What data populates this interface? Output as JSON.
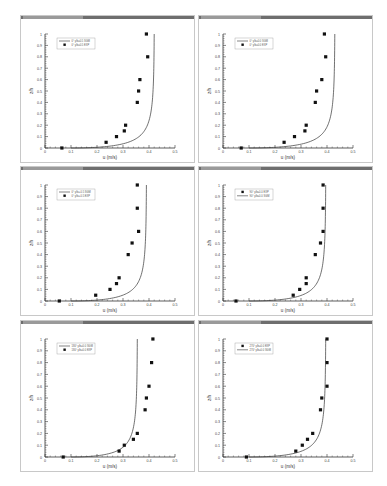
{
  "layout": {
    "panels": [
      {
        "x": 20,
        "y": 15,
        "w": 175,
        "h": 148
      },
      {
        "x": 198,
        "y": 15,
        "w": 175,
        "h": 148
      },
      {
        "x": 20,
        "y": 166,
        "w": 175,
        "h": 150
      },
      {
        "x": 198,
        "y": 166,
        "w": 175,
        "h": 150
      },
      {
        "x": 20,
        "y": 320,
        "w": 175,
        "h": 152
      },
      {
        "x": 198,
        "y": 320,
        "w": 175,
        "h": 152
      }
    ]
  },
  "colors": {
    "line": "#333333",
    "marker": "#111111",
    "axis": "#333333",
    "frame": "#c8c8c8",
    "titlebar": "#6e6e6e"
  },
  "chart_data": [
    {
      "type": "scatter",
      "title": "",
      "xlabel": "u (m/s)",
      "ylabel": "z/h",
      "xlim": [
        0,
        0.5
      ],
      "ylim": [
        0,
        1
      ],
      "xticks": [
        "0",
        "0.1",
        "0.2",
        "0.3",
        "0.4",
        "0.5"
      ],
      "yticks": [
        "0",
        "0.1",
        "0.2",
        "0.3",
        "0.4",
        "0.5",
        "0.6",
        "0.7",
        "0.8",
        "0.9",
        "1"
      ],
      "legend_order": [
        "line",
        "marker"
      ],
      "legend_pos": "upper-left",
      "series": [
        {
          "name": "0° y/b=0.5 SGM",
          "kind": "line",
          "asymptote": 0.42,
          "u_bed": 0.1
        },
        {
          "name": "0° y/b=0.5 EXP",
          "kind": "marker",
          "x": [
            0.065,
            0.235,
            0.275,
            0.305,
            0.31,
            0.355,
            0.36,
            0.365,
            0.395,
            0.39
          ],
          "y": [
            0,
            0.05,
            0.1,
            0.15,
            0.2,
            0.4,
            0.5,
            0.6,
            0.8,
            1.0
          ]
        }
      ]
    },
    {
      "type": "scatter",
      "title": "",
      "xlabel": "u (m/s)",
      "ylabel": "z/h",
      "xlim": [
        0,
        0.5
      ],
      "ylim": [
        0,
        1
      ],
      "xticks": [
        "0",
        "0.1",
        "0.2",
        "0.3",
        "0.4",
        "0.5"
      ],
      "yticks": [
        "0",
        "0.1",
        "0.2",
        "0.3",
        "0.4",
        "0.5",
        "0.6",
        "0.7",
        "0.8",
        "0.9",
        "1"
      ],
      "legend_order": [
        "line",
        "marker"
      ],
      "legend_pos": "upper-left",
      "series": [
        {
          "name": "0° y/b=0.0 SGM",
          "kind": "line",
          "asymptote": 0.43,
          "u_bed": 0.1
        },
        {
          "name": "0° y/b=0.0 EXP",
          "kind": "marker",
          "x": [
            0.07,
            0.235,
            0.275,
            0.315,
            0.32,
            0.355,
            0.36,
            0.38,
            0.395,
            0.39
          ],
          "y": [
            0,
            0.05,
            0.1,
            0.15,
            0.2,
            0.4,
            0.5,
            0.6,
            0.8,
            1.0
          ]
        }
      ]
    },
    {
      "type": "scatter",
      "title": "",
      "xlabel": "u (m/s)",
      "ylabel": "z/h",
      "xlim": [
        0,
        0.5
      ],
      "ylim": [
        0,
        1
      ],
      "xticks": [
        "0",
        "0.1",
        "0.2",
        "0.3",
        "0.4",
        "0.5"
      ],
      "yticks": [
        "0",
        "0.1",
        "0.2",
        "0.3",
        "0.4",
        "0.5",
        "0.6",
        "0.7",
        "0.8",
        "0.9",
        "1"
      ],
      "legend_order": [
        "line",
        "marker"
      ],
      "legend_pos": "upper-left",
      "series": [
        {
          "name": "0° y/b=-0.5 SGM",
          "kind": "line",
          "asymptote": 0.39,
          "u_bed": 0.1
        },
        {
          "name": "0° y/b=-0.5 EXP",
          "kind": "marker",
          "x": [
            0.055,
            0.195,
            0.25,
            0.275,
            0.285,
            0.32,
            0.335,
            0.36,
            0.355,
            0.355
          ],
          "y": [
            0,
            0.05,
            0.1,
            0.15,
            0.2,
            0.4,
            0.5,
            0.6,
            0.8,
            1.0
          ]
        }
      ]
    },
    {
      "type": "scatter",
      "title": "",
      "xlabel": "u (m/s)",
      "ylabel": "z/h",
      "xlim": [
        0,
        0.5
      ],
      "ylim": [
        0,
        1
      ],
      "xticks": [
        "0",
        "0.1",
        "0.2",
        "0.3",
        "0.4",
        "0.5"
      ],
      "yticks": [
        "0",
        "0.1",
        "0.2",
        "0.3",
        "0.4",
        "0.5",
        "0.6",
        "0.7",
        "0.8",
        "0.9",
        "1"
      ],
      "legend_order": [
        "marker",
        "line"
      ],
      "legend_pos": "upper-left",
      "series": [
        {
          "name": "90° y/b=0.0 EXP",
          "kind": "marker",
          "x": [
            0.05,
            0.27,
            0.295,
            0.32,
            0.32,
            0.355,
            0.375,
            0.385,
            0.385,
            0.385
          ],
          "y": [
            0,
            0.05,
            0.1,
            0.15,
            0.2,
            0.4,
            0.5,
            0.6,
            0.8,
            1.0
          ]
        },
        {
          "name": "90° y/b=0.0 SGM",
          "kind": "line",
          "asymptote": 0.395,
          "u_bed": 0.1
        }
      ]
    },
    {
      "type": "scatter",
      "title": "",
      "xlabel": "u (m/s)",
      "ylabel": "z/h",
      "xlim": [
        0,
        0.5
      ],
      "ylim": [
        0,
        1
      ],
      "xticks": [
        "0",
        "0.1",
        "0.2",
        "0.3",
        "0.4",
        "0.5"
      ],
      "yticks": [
        "0",
        "0.1",
        "0.2",
        "0.3",
        "0.4",
        "0.5",
        "0.6",
        "0.7",
        "0.8",
        "0.9",
        "1"
      ],
      "legend_order": [
        "line",
        "marker"
      ],
      "legend_pos": "upper-left",
      "series": [
        {
          "name": "180° y/b=0.0 SGM",
          "kind": "line",
          "asymptote": 0.355,
          "u_bed": 0.1
        },
        {
          "name": "180° y/b=0.0 EXP",
          "kind": "marker",
          "x": [
            0.07,
            0.285,
            0.305,
            0.34,
            0.355,
            0.385,
            0.39,
            0.4,
            0.41,
            0.415
          ],
          "y": [
            0,
            0.05,
            0.1,
            0.15,
            0.2,
            0.4,
            0.5,
            0.6,
            0.8,
            1.0
          ]
        }
      ]
    },
    {
      "type": "scatter",
      "title": "",
      "xlabel": "u (m/s)",
      "ylabel": "z/h",
      "xlim": [
        0,
        0.5
      ],
      "ylim": [
        0,
        1
      ],
      "xticks": [
        "0",
        "0.1",
        "0.2",
        "0.3",
        "0.4",
        "0.5"
      ],
      "yticks": [
        "0",
        "0.1",
        "0.2",
        "0.3",
        "0.4",
        "0.5",
        "0.6",
        "0.7",
        "0.8",
        "0.9",
        "1"
      ],
      "legend_order": [
        "marker",
        "line"
      ],
      "legend_pos": "upper-left",
      "series": [
        {
          "name": "270° y/b=0.0 EXP",
          "kind": "marker",
          "x": [
            0.09,
            0.28,
            0.305,
            0.325,
            0.345,
            0.375,
            0.38,
            0.4,
            0.4,
            0.4
          ],
          "y": [
            0,
            0.05,
            0.1,
            0.15,
            0.2,
            0.4,
            0.5,
            0.6,
            0.8,
            1.0
          ]
        },
        {
          "name": "270° y/b=0.0 SGM",
          "kind": "line",
          "asymptote": 0.395,
          "u_bed": 0.1
        }
      ]
    }
  ]
}
